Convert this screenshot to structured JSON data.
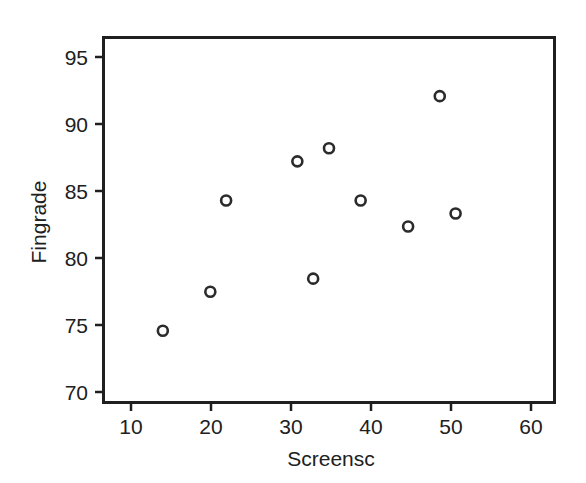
{
  "chart_data": {
    "type": "scatter",
    "title": "",
    "xlabel": "Screensc",
    "ylabel": "Fingrade",
    "xlim": [
      6.5,
      63.5
    ],
    "ylim": [
      68.5,
      96.5
    ],
    "xticks": [
      10,
      20,
      30,
      40,
      50,
      60
    ],
    "yticks": [
      70,
      75,
      80,
      85,
      90,
      95
    ],
    "xtick_labels": [
      "10",
      "20",
      "30",
      "40",
      "50",
      "60"
    ],
    "ytick_labels": [
      "70",
      "75",
      "80",
      "85",
      "90",
      "95"
    ],
    "grid": false,
    "legend": false,
    "legend_position": "none",
    "marker": "open-circle",
    "marker_color": "#2b2b2b",
    "marker_fill": "#ffffff",
    "frame": true,
    "points": [
      {
        "x": 14,
        "y": 74
      },
      {
        "x": 20,
        "y": 77
      },
      {
        "x": 22,
        "y": 84
      },
      {
        "x": 31,
        "y": 87
      },
      {
        "x": 33,
        "y": 78
      },
      {
        "x": 35,
        "y": 88
      },
      {
        "x": 39,
        "y": 84
      },
      {
        "x": 45,
        "y": 82
      },
      {
        "x": 49,
        "y": 92
      },
      {
        "x": 51,
        "y": 83
      }
    ],
    "series": [
      {
        "name": "Screensc vs Fingrade",
        "x": [
          14,
          20,
          22,
          31,
          33,
          35,
          39,
          45,
          49,
          51
        ],
        "values": [
          74,
          77,
          84,
          87,
          78,
          88,
          84,
          82,
          92,
          83
        ]
      }
    ]
  },
  "colors": {
    "background": "#ffffff",
    "axis": "#1f1f1f",
    "text": "#202020",
    "marker": "#2b2b2b"
  }
}
